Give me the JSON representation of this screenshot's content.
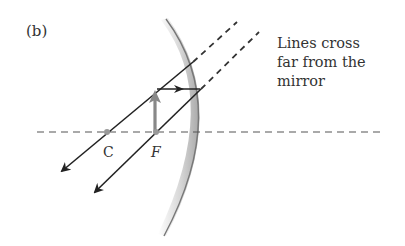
{
  "figure": {
    "panel_label": "(b)",
    "caption_lines": [
      "Lines cross",
      "far from the",
      "mirror"
    ],
    "points": {
      "center_of_curvature": {
        "label": "C",
        "x": 107,
        "y": 132
      },
      "focal_point": {
        "label": "F",
        "x": 156,
        "y": 132
      }
    },
    "colors": {
      "ray": "#222222",
      "object_arrow": "#888888",
      "axis": "#555555",
      "mirror_dark": "#9a9a9a",
      "mirror_light": "#f0f0f0",
      "text": "#333333"
    }
  }
}
